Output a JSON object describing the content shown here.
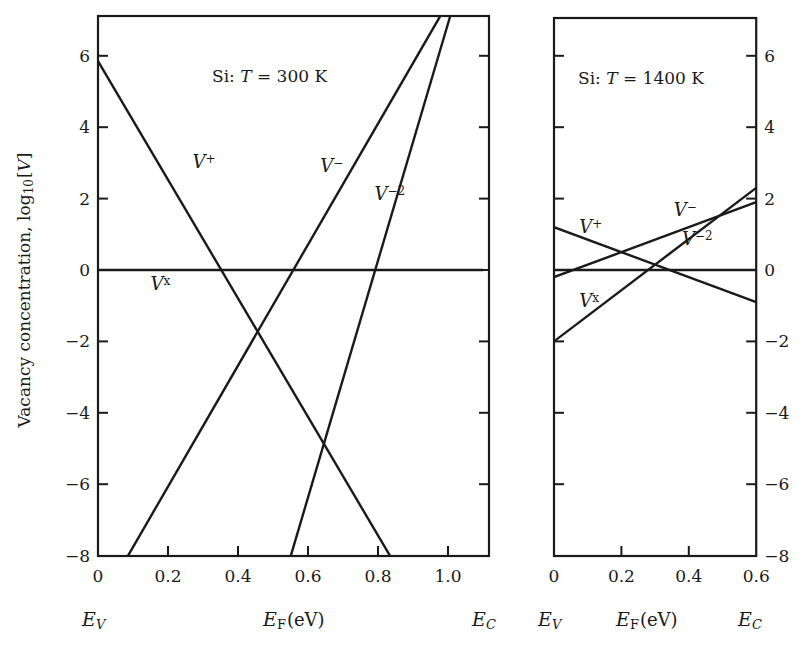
{
  "chart_data": [
    {
      "type": "line",
      "title": "Si: T = 300 K",
      "title_parts": {
        "prefix": "Si:",
        "var": "T",
        "rest": " = 300 K"
      },
      "xlabel": "E_F (eV)",
      "ylabel": "Vacancy concentration, log10[V]",
      "xlim": [
        0,
        1.1
      ],
      "ylim": [
        -8,
        7.1
      ],
      "xticks": [
        0,
        0.2,
        0.4,
        0.6,
        0.8,
        1.0
      ],
      "xtick_labels": [
        "0",
        "0.2",
        "0.4",
        "0.6",
        "0.8",
        "1.0"
      ],
      "yticks": [
        -8,
        -6,
        -4,
        -2,
        0,
        2,
        4,
        6
      ],
      "ytick_labels": [
        "−8",
        "−6",
        "−4",
        "−2",
        "0",
        "2",
        "4",
        "6"
      ],
      "band_labels": {
        "left": "E_V",
        "right": "E_C"
      },
      "series": [
        {
          "name": "V+",
          "label_base": "V",
          "label_sup": "+",
          "x": [
            0,
            0.834
          ],
          "y": [
            5.85,
            -8
          ],
          "label_pos": [
            0.27,
            2.85
          ]
        },
        {
          "name": "V-",
          "label_base": "V",
          "label_sup": "−",
          "x": [
            0.086,
            0.977
          ],
          "y": [
            -8,
            7.1
          ],
          "label_pos": [
            0.635,
            2.75
          ]
        },
        {
          "name": "V-2",
          "label_base": "V",
          "label_sup": "−2",
          "x": [
            0.551,
            1.006
          ],
          "y": [
            -8,
            7.1
          ],
          "label_pos": [
            0.79,
            1.95
          ]
        },
        {
          "name": "Vx",
          "label_base": "V",
          "label_sup": "x",
          "x": [
            0,
            1.1
          ],
          "y": [
            0,
            0
          ],
          "label_pos": [
            0.15,
            -0.55
          ]
        }
      ]
    },
    {
      "type": "line",
      "title": "Si: T = 1400 K",
      "title_parts": {
        "prefix": "Si:",
        "var": "T",
        "rest": " = 1400 K"
      },
      "xlabel": "E_F (eV)",
      "ylabel": "",
      "xlim": [
        0,
        0.6
      ],
      "ylim": [
        -8,
        7.1
      ],
      "xticks": [
        0,
        0.2,
        0.4,
        0.6
      ],
      "xtick_labels": [
        "0",
        "0.2",
        "0.4",
        "0.6"
      ],
      "yticks": [
        -8,
        -6,
        -4,
        -2,
        0,
        2,
        4,
        6
      ],
      "ytick_labels": [
        "−8",
        "−6",
        "−4",
        "−2",
        "0",
        "2",
        "4",
        "6"
      ],
      "band_labels": {
        "left": "E_V",
        "right": "E_C"
      },
      "series": [
        {
          "name": "V+",
          "label_base": "V",
          "label_sup": "+",
          "x": [
            0,
            0.6
          ],
          "y": [
            1.2,
            -0.9
          ],
          "label_pos": [
            0.075,
            1.05
          ]
        },
        {
          "name": "V-",
          "label_base": "V",
          "label_sup": "−",
          "x": [
            0,
            0.6
          ],
          "y": [
            -0.2,
            1.9
          ],
          "label_pos": [
            0.355,
            1.5
          ]
        },
        {
          "name": "V-2",
          "label_base": "V",
          "label_sup": "−2",
          "x": [
            0,
            0.6
          ],
          "y": [
            -2.0,
            2.3
          ],
          "label_pos": [
            0.38,
            0.7
          ]
        },
        {
          "name": "Vx",
          "label_base": "V",
          "label_sup": "x",
          "x": [
            0,
            0.6
          ],
          "y": [
            0,
            0
          ],
          "label_pos": [
            0.075,
            -1.05
          ]
        }
      ]
    }
  ],
  "layout": {
    "ylabel_text": "Vacancy concentration, log",
    "ylabel_sub": "10",
    "ylabel_tail": "[V]",
    "ylabel_var": "V",
    "xlabel_var": "E",
    "xlabel_sub": "F",
    "xlabel_unit": "(eV)",
    "ev_var": "E",
    "ev_sub": "V",
    "ec_var": "E",
    "ec_sub": "C",
    "line_color": "#1a1a1a",
    "panels": [
      {
        "x0": 98,
        "x1": 489,
        "y_top": 16,
        "y_bot": 556,
        "px_per_x": 350,
        "y_zero": 270,
        "px_per_y": 35.7,
        "yaxis_side": "left"
      },
      {
        "x0": 554,
        "x1": 756,
        "y_top": 18,
        "y_bot": 556,
        "px_per_x": 337,
        "y_zero": 270,
        "px_per_y": 35.7,
        "yaxis_side": "right"
      }
    ]
  }
}
